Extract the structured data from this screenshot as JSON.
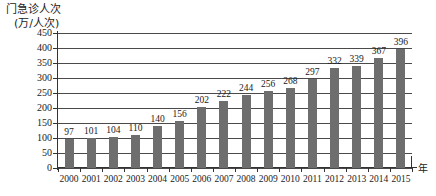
{
  "chart_data": {
    "type": "bar",
    "title": "",
    "ylabel": "门急诊人次",
    "ylabel_unit": "(万/人次)",
    "xlabel": "年",
    "categories": [
      "2000",
      "2001",
      "2002",
      "2003",
      "2004",
      "2005",
      "2006",
      "2007",
      "2008",
      "2009",
      "2010",
      "2011",
      "2012",
      "2013",
      "2014",
      "2015"
    ],
    "values": [
      97,
      101,
      104,
      110,
      140,
      156,
      202,
      222,
      244,
      256,
      268,
      297,
      332,
      339,
      367,
      396
    ],
    "ylim": [
      0,
      450
    ],
    "ytick_labels": [
      "0",
      "50",
      "100",
      "150",
      "200",
      "250",
      "300",
      "350",
      "400",
      "450"
    ],
    "ytick_values": [
      0,
      50,
      100,
      150,
      200,
      250,
      300,
      350,
      400,
      450
    ],
    "grid": true,
    "legend": null,
    "bar_color": "#6e6e6e",
    "axis_color": "#333333",
    "grid_color": "#4a4a4a",
    "background": "#ffffff"
  }
}
